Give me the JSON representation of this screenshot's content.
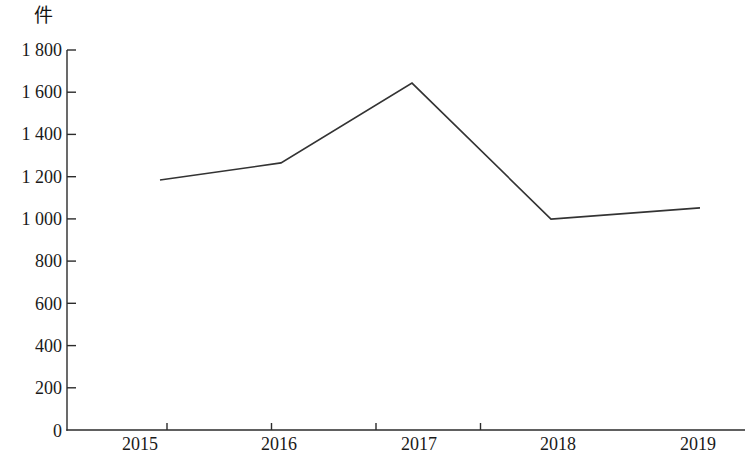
{
  "chart_data": {
    "type": "line",
    "title": "",
    "subtitle": "",
    "unit_label": "件",
    "xlabel": "",
    "ylabel": "",
    "categories": [
      "2015",
      "2016",
      "2017",
      "2018",
      "2019"
    ],
    "series": [
      {
        "name": "",
        "values": [
          1184,
          1265,
          1643,
          999,
          1052
        ]
      }
    ],
    "ylim": [
      0,
      1800
    ],
    "y_ticks": [
      0,
      200,
      400,
      600,
      800,
      1000,
      1200,
      1400,
      1600,
      1800
    ],
    "y_tick_labels": [
      "0",
      "200",
      "400",
      "600",
      "800",
      "1 000",
      "1 200",
      "1 400",
      "1 600",
      "1 800"
    ],
    "x_tick_labels": [
      "2015",
      "2016",
      "2017",
      "2018",
      "2019"
    ],
    "grid": false,
    "legend": "none",
    "line_color": "#333333",
    "axis_color": "#2b2b2b"
  }
}
